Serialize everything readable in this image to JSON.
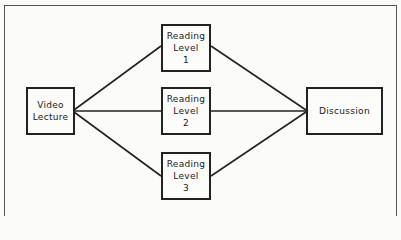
{
  "diagram": {
    "type": "flow",
    "nodes": [
      {
        "id": "video",
        "lines": [
          "Video",
          "Lecture"
        ]
      },
      {
        "id": "r1",
        "lines": [
          "Reading",
          "Level",
          "1"
        ]
      },
      {
        "id": "r2",
        "lines": [
          "Reading",
          "Level",
          "2"
        ]
      },
      {
        "id": "r3",
        "lines": [
          "Reading",
          "Level",
          "3"
        ]
      },
      {
        "id": "discussion",
        "lines": [
          "Discussion"
        ]
      }
    ],
    "edges": [
      [
        "video",
        "r1"
      ],
      [
        "video",
        "r2"
      ],
      [
        "video",
        "r3"
      ],
      [
        "r1",
        "discussion"
      ],
      [
        "r2",
        "discussion"
      ],
      [
        "r3",
        "discussion"
      ]
    ],
    "colors": {
      "line": "#222222",
      "background": "#fbfbf9"
    }
  }
}
